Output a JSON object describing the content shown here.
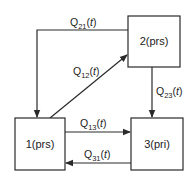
{
  "diagram": {
    "type": "state-transition",
    "nodes": [
      {
        "id": "1",
        "label": "1(prs)"
      },
      {
        "id": "2",
        "label": "2(prs)"
      },
      {
        "id": "3",
        "label": "3(pri)"
      }
    ],
    "edges": [
      {
        "from": "2",
        "to": "1",
        "q": "Q",
        "sub": "21",
        "arg": "(t)"
      },
      {
        "from": "1",
        "to": "2",
        "q": "Q",
        "sub": "12",
        "arg": "(t)"
      },
      {
        "from": "2",
        "to": "3",
        "q": "Q",
        "sub": "23",
        "arg": "(t)"
      },
      {
        "from": "1",
        "to": "3",
        "q": "Q",
        "sub": "13",
        "arg": "(t)"
      },
      {
        "from": "3",
        "to": "1",
        "q": "Q",
        "sub": "31",
        "arg": "(t)"
      }
    ],
    "colors": {
      "stroke": "#2a2a2a",
      "text": "#222222",
      "background": "#ffffff"
    }
  }
}
